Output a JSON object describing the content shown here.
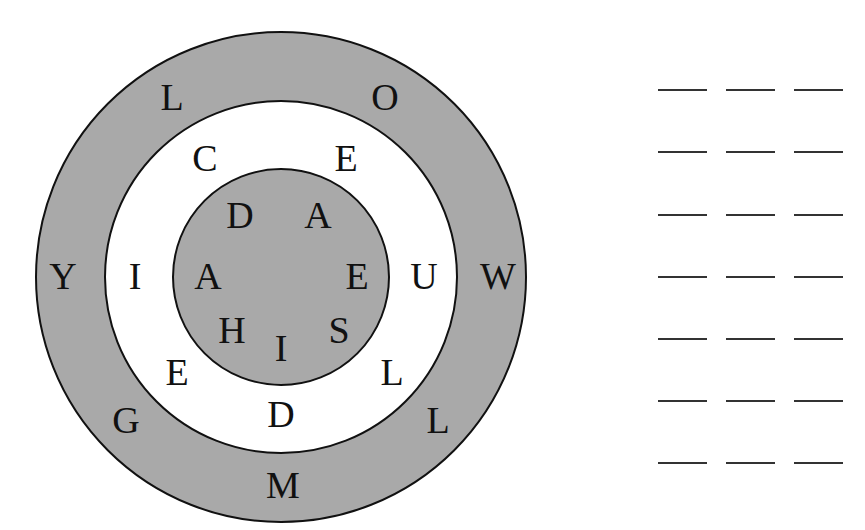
{
  "colors": {
    "ring_fill": "#a9a9a9",
    "background": "#ffffff",
    "ink": "#111111"
  },
  "circle": {
    "center": [
      281,
      277
    ],
    "outer_ring": {
      "radius": 246,
      "fill": "gray",
      "letters": [
        {
          "char": "L",
          "x": 172,
          "y": 97
        },
        {
          "char": "O",
          "x": 385,
          "y": 97
        },
        {
          "char": "Y",
          "x": 63,
          "y": 276
        },
        {
          "char": "W",
          "x": 498,
          "y": 276
        },
        {
          "char": "G",
          "x": 126,
          "y": 420
        },
        {
          "char": "L",
          "x": 438,
          "y": 420
        },
        {
          "char": "M",
          "x": 283,
          "y": 485
        }
      ]
    },
    "middle_ring": {
      "radius": 177,
      "fill": "white",
      "letters": [
        {
          "char": "C",
          "x": 205,
          "y": 158
        },
        {
          "char": "E",
          "x": 346,
          "y": 158
        },
        {
          "char": "I",
          "x": 135,
          "y": 276
        },
        {
          "char": "U",
          "x": 424,
          "y": 276
        },
        {
          "char": "E",
          "x": 177,
          "y": 372
        },
        {
          "char": "L",
          "x": 392,
          "y": 372
        },
        {
          "char": "D",
          "x": 281,
          "y": 414
        }
      ]
    },
    "inner_circle": {
      "radius": 109,
      "fill": "gray",
      "letters": [
        {
          "char": "D",
          "x": 240,
          "y": 215
        },
        {
          "char": "A",
          "x": 318,
          "y": 215
        },
        {
          "char": "A",
          "x": 208,
          "y": 276
        },
        {
          "char": "E",
          "x": 357,
          "y": 276
        },
        {
          "char": "H",
          "x": 232,
          "y": 330
        },
        {
          "char": "I",
          "x": 281,
          "y": 348
        },
        {
          "char": "S",
          "x": 339,
          "y": 330
        }
      ]
    }
  },
  "answer_blanks": {
    "columns_x": [
      [
        658,
        707
      ],
      [
        726,
        775
      ],
      [
        794,
        843
      ]
    ],
    "rows_y": [
      90,
      152,
      215,
      277,
      339,
      401,
      463
    ],
    "count": 21
  }
}
